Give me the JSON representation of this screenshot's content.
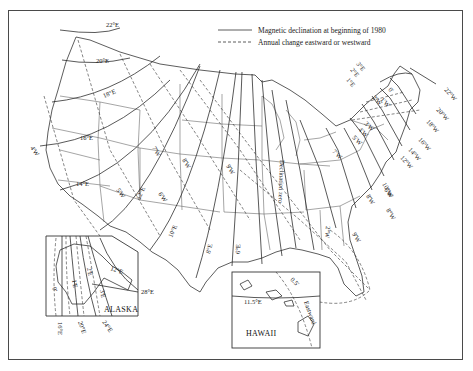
{
  "legend": {
    "solid_label": "Magnetic declination at beginning of 1980",
    "dashed_label": "Annual change eastward or westward"
  },
  "isogonic_labels": {
    "east": [
      "22°E",
      "20°E",
      "18°E",
      "16°E",
      "14°E",
      "12°E",
      "10°E",
      "8°E",
      "6°E",
      "4°E",
      "2°E",
      "1°E",
      "0°",
      "1°E",
      "2°E",
      "3°E"
    ],
    "west": [
      "1°W",
      "2°W",
      "3°W",
      "4°W",
      "5°W",
      "6°W",
      "7°W",
      "8°W",
      "9°W",
      "10°W",
      "12°W",
      "14°W",
      "16°W",
      "18°W",
      "20°W",
      "22°W"
    ]
  },
  "annual_change_labels": [
    "4'W",
    "5'W",
    "6'W",
    "7'W",
    "8'W",
    "9'W",
    "3'W",
    "4'W",
    "5'W",
    "6'W",
    "7'W",
    "8'W",
    "9'W",
    "2'W",
    "1'W",
    "0'",
    "1'E",
    "2'E",
    "3'E",
    "0.5'"
  ],
  "agonic_line_label": "Declination zero",
  "alaska": {
    "title": "ALASKA",
    "labels": [
      "12°E",
      "28°E",
      "16°E",
      "20°E",
      "24°E",
      "1'E",
      "2'E",
      "3'E",
      "0'"
    ]
  },
  "hawaii": {
    "title": "HAWAII",
    "labels": [
      "11.5°E",
      "0.5'",
      "Eastward"
    ]
  }
}
